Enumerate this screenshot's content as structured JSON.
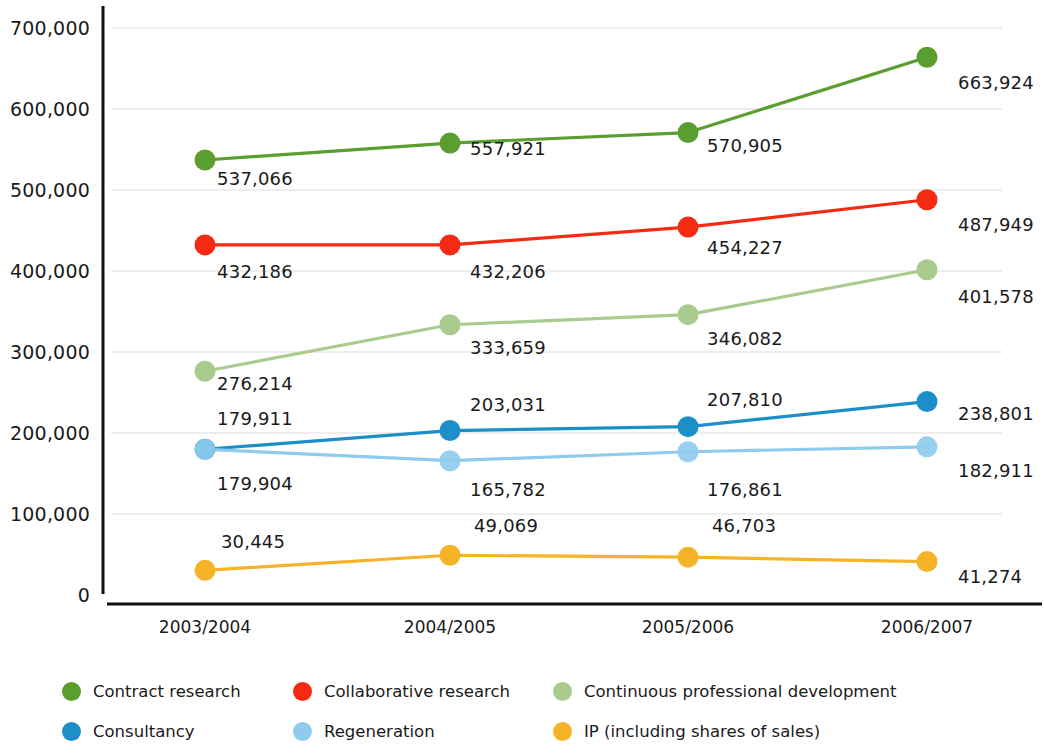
{
  "chart_data": {
    "type": "line",
    "title": "",
    "subtitle": "",
    "xlabel": "",
    "ylabel": "",
    "categories": [
      "2003/2004",
      "2004/2005",
      "2005/2006",
      "2006/2007"
    ],
    "ylim": [
      0,
      700000
    ],
    "y_ticks": [
      0,
      100000,
      200000,
      300000,
      400000,
      500000,
      600000,
      700000
    ],
    "y_tick_labels": [
      "0",
      "100,000",
      "200,000",
      "300,000",
      "400,000",
      "500,000",
      "600,000",
      "700,000"
    ],
    "grid": true,
    "legend_position": "bottom",
    "series": [
      {
        "name": "Contract research",
        "color": "#5a9e2f",
        "values": [
          537066,
          557921,
          570905,
          663924
        ],
        "labels": [
          "537,066",
          "557,921",
          "570,905",
          "663,924"
        ]
      },
      {
        "name": "Collaborative research",
        "color": "#f52a13",
        "values": [
          432186,
          432206,
          454227,
          487949
        ],
        "labels": [
          "432,186",
          "432,206",
          "454,227",
          "487,949"
        ]
      },
      {
        "name": "Continuous professional development",
        "color": "#a9cb8e",
        "values": [
          276214,
          333659,
          346082,
          401578
        ],
        "labels": [
          "276,214",
          "333,659",
          "346,082",
          "401,578"
        ]
      },
      {
        "name": "Consultancy",
        "color": "#1c8fc9",
        "values": [
          179911,
          203031,
          207810,
          238801
        ],
        "labels": [
          "179,911",
          "203,031",
          "207,810",
          "238,801"
        ]
      },
      {
        "name": "Regeneration",
        "color": "#8ecbed",
        "values": [
          179904,
          165782,
          176861,
          182911
        ],
        "labels": [
          "179,904",
          "165,782",
          "176,861",
          "182,911"
        ]
      },
      {
        "name": "IP (including shares of sales)",
        "color": "#f6b327",
        "values": [
          30445,
          49069,
          46703,
          41274
        ],
        "labels": [
          "30,445",
          "49,069",
          "46,703",
          "41,274"
        ]
      }
    ]
  },
  "legend": {
    "items": [
      {
        "label": "Contract research",
        "color": "#5a9e2f",
        "icon": "circle-swatch-icon"
      },
      {
        "label": "Collaborative research",
        "color": "#f52a13",
        "icon": "circle-swatch-icon"
      },
      {
        "label": "Continuous professional development",
        "color": "#a9cb8e",
        "icon": "circle-swatch-icon"
      },
      {
        "label": "Consultancy",
        "color": "#1c8fc9",
        "icon": "circle-swatch-icon"
      },
      {
        "label": "Regeneration",
        "color": "#8ecbed",
        "icon": "circle-swatch-icon"
      },
      {
        "label": "IP (including shares of sales)",
        "color": "#f6b327",
        "icon": "circle-swatch-icon"
      }
    ]
  },
  "axes": {
    "y_axis_color": "#111111",
    "x_axis_color": "#111111",
    "gridline_color": "#e8e8e8"
  },
  "label_placements": [
    {
      "series": 0,
      "point": 0,
      "text": "537,066",
      "x": 255,
      "y": 178,
      "anchor": "center"
    },
    {
      "series": 0,
      "point": 1,
      "text": "557,921",
      "x": 508,
      "y": 148,
      "anchor": "center"
    },
    {
      "series": 0,
      "point": 2,
      "text": "570,905",
      "x": 745,
      "y": 145,
      "anchor": "center"
    },
    {
      "series": 0,
      "point": 3,
      "text": "663,924",
      "x": 958,
      "y": 82,
      "anchor": "left"
    },
    {
      "series": 1,
      "point": 0,
      "text": "432,186",
      "x": 255,
      "y": 271,
      "anchor": "center"
    },
    {
      "series": 1,
      "point": 1,
      "text": "432,206",
      "x": 508,
      "y": 271,
      "anchor": "center"
    },
    {
      "series": 1,
      "point": 2,
      "text": "454,227",
      "x": 745,
      "y": 247,
      "anchor": "center"
    },
    {
      "series": 1,
      "point": 3,
      "text": "487,949",
      "x": 958,
      "y": 224,
      "anchor": "left"
    },
    {
      "series": 2,
      "point": 0,
      "text": "276,214",
      "x": 255,
      "y": 383,
      "anchor": "center"
    },
    {
      "series": 2,
      "point": 1,
      "text": "333,659",
      "x": 508,
      "y": 347,
      "anchor": "center"
    },
    {
      "series": 2,
      "point": 2,
      "text": "346,082",
      "x": 745,
      "y": 338,
      "anchor": "center"
    },
    {
      "series": 2,
      "point": 3,
      "text": "401,578",
      "x": 958,
      "y": 296,
      "anchor": "left"
    },
    {
      "series": 3,
      "point": 0,
      "text": "179,911",
      "x": 255,
      "y": 418,
      "anchor": "center"
    },
    {
      "series": 3,
      "point": 1,
      "text": "203,031",
      "x": 508,
      "y": 404,
      "anchor": "center"
    },
    {
      "series": 3,
      "point": 2,
      "text": "207,810",
      "x": 745,
      "y": 399,
      "anchor": "center"
    },
    {
      "series": 3,
      "point": 3,
      "text": "238,801",
      "x": 958,
      "y": 413,
      "anchor": "left"
    },
    {
      "series": 4,
      "point": 0,
      "text": "179,904",
      "x": 255,
      "y": 483,
      "anchor": "center"
    },
    {
      "series": 4,
      "point": 1,
      "text": "165,782",
      "x": 508,
      "y": 489,
      "anchor": "center"
    },
    {
      "series": 4,
      "point": 2,
      "text": "176,861",
      "x": 745,
      "y": 489,
      "anchor": "center"
    },
    {
      "series": 4,
      "point": 3,
      "text": "182,911",
      "x": 958,
      "y": 470,
      "anchor": "left"
    },
    {
      "series": 5,
      "point": 0,
      "text": "30,445",
      "x": 253,
      "y": 541,
      "anchor": "center"
    },
    {
      "series": 5,
      "point": 1,
      "text": "49,069",
      "x": 506,
      "y": 525,
      "anchor": "center"
    },
    {
      "series": 5,
      "point": 2,
      "text": "46,703",
      "x": 744,
      "y": 525,
      "anchor": "center"
    },
    {
      "series": 5,
      "point": 3,
      "text": "41,274",
      "x": 958,
      "y": 576,
      "anchor": "left"
    }
  ]
}
